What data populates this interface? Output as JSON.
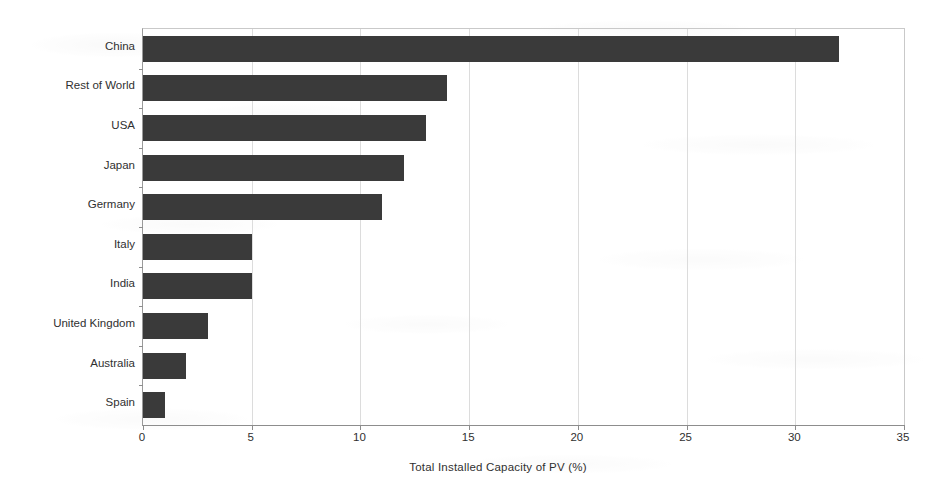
{
  "chart_data": {
    "type": "bar",
    "orientation": "horizontal",
    "title": "",
    "xlabel": "Total Installed Capacity of PV  (%)",
    "ylabel": "",
    "categories": [
      "China",
      "Rest of World",
      "USA",
      "Japan",
      "Germany",
      "Italy",
      "India",
      "United Kingdom",
      "Australia",
      "Spain"
    ],
    "values": [
      32,
      14,
      13,
      12,
      11,
      5,
      5,
      3,
      2,
      1
    ],
    "xlim": [
      0,
      35
    ],
    "xticks": [
      0,
      5,
      10,
      15,
      20,
      25,
      30,
      35
    ],
    "xtick_labels": [
      "0",
      "5",
      "10",
      "15",
      "20",
      "25",
      "30",
      "35"
    ],
    "grid": "vertical",
    "legend": null,
    "bar_color": "#3a3a3a",
    "gridline_color": "#dcdcdc",
    "axis_color": "#8d8d8d",
    "background_color": "#ffffff"
  }
}
